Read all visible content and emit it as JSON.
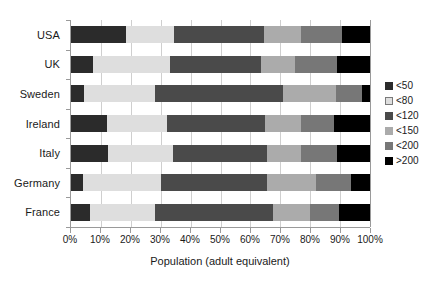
{
  "chart_data": {
    "type": "bar",
    "orientation": "horizontal",
    "stacked": true,
    "normalized_percent": true,
    "title": "",
    "xlabel": "Population (adult equivalent)",
    "ylabel": "",
    "xlim": [
      0,
      100
    ],
    "grid": true,
    "legend_position": "right",
    "categories": [
      "USA",
      "UK",
      "Sweden",
      "Ireland",
      "Italy",
      "Germany",
      "France"
    ],
    "xticks": [
      0,
      10,
      20,
      30,
      40,
      50,
      60,
      70,
      80,
      90,
      100
    ],
    "xticklabels": [
      "0%",
      "10%",
      "20%",
      "30%",
      "40%",
      "50%",
      "60%",
      "70%",
      "80%",
      "90%",
      "100%"
    ],
    "series": [
      {
        "name": "<50",
        "color": "#2b2b2b",
        "values": [
          18.5,
          7.5,
          4.5,
          12.0,
          12.5,
          4.0,
          6.5
        ]
      },
      {
        "name": "<80",
        "color": "#dedede",
        "values": [
          16.0,
          25.5,
          23.5,
          20.0,
          21.5,
          26.0,
          21.5
        ]
      },
      {
        "name": "<120",
        "color": "#4a4a4a",
        "values": [
          30.0,
          30.5,
          43.0,
          33.0,
          31.5,
          35.5,
          39.5
        ]
      },
      {
        "name": "<150",
        "color": "#ababab",
        "values": [
          12.5,
          11.5,
          17.5,
          12.0,
          11.5,
          16.5,
          12.5
        ]
      },
      {
        "name": "<200",
        "color": "#777777",
        "values": [
          13.5,
          14.0,
          9.0,
          11.0,
          12.0,
          11.5,
          9.5
        ]
      },
      {
        "name": ">200",
        "color": "#000000",
        "values": [
          9.5,
          11.0,
          2.5,
          12.0,
          11.0,
          6.5,
          10.5
        ]
      }
    ]
  },
  "legend": {
    "items": [
      {
        "label": "<50",
        "color": "#2b2b2b"
      },
      {
        "label": "<80",
        "color": "#dedede"
      },
      {
        "label": "<120",
        "color": "#4a4a4a"
      },
      {
        "label": "<150",
        "color": "#ababab"
      },
      {
        "label": "<200",
        "color": "#777777"
      },
      {
        "label": ">200",
        "color": "#000000"
      }
    ]
  },
  "axis": {
    "x_title": "Population (adult equivalent)"
  },
  "colors": {
    "gridline": "#cfcfcf",
    "axis": "#9a9a9a",
    "text": "#1a1a1a",
    "background": "#ffffff"
  }
}
